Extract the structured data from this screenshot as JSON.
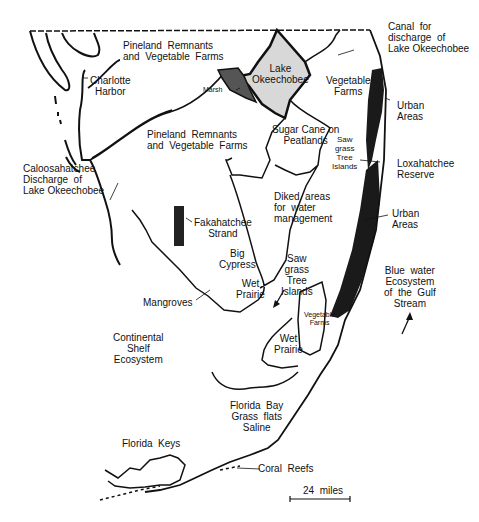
{
  "map": {
    "title": "South Florida ecosystems",
    "colors": {
      "ink": "#111111",
      "lake_fill": "#d8d8d8",
      "urban_fill": "#1a1a1a",
      "marsh_fill": "#555555",
      "background": "#ffffff"
    },
    "labels": {
      "pineland_north": "Pineland  Remnants\nand  Vegetable  Farms",
      "canal": "Canal  for\ndischarge  of\nLake Okeechobee",
      "charlotte_harbor": "Charlotte\nHarbor",
      "lake_okeechobee": "Lake\nOkeechobee",
      "marsh": "Marsh",
      "vegetable_farms_north": "Vegetable\nFarms",
      "urban_areas_north": "Urban\nAreas",
      "pineland_central": "Pineland  Remnants\nand  Vegetable  Farms",
      "sugar_cane": "Sugar Cane on\nPeatlands",
      "sawgrass_north": "Saw\ngrass\nTree\nIslands",
      "loxahatchee": "Loxahatchee\nReserve",
      "caloosahatchee": "Caloosahatchee\nDischarge  of\nLake Okeechobee",
      "diked_areas": "Diked  areas\nfor  water\nmanagement",
      "urban_areas_south": "Urban\nAreas",
      "fakahatchee": "Fakahatchee\nStrand",
      "big_cypress": "Big\nCypress",
      "wet_prairie_west": "Wet\nPrairie",
      "sawgrass_south": "Saw\ngrass\nTree\nIslands",
      "blue_water": "Blue  water\nEcosystem\nof  the  Gulf\nStream",
      "mangroves": "Mangroves",
      "vegetable_farms_south": "Vegetable\nFarms",
      "wet_prairie_east": "Wet\nPrairie",
      "continental_shelf": "Continental\nShelf\nEcosystem",
      "florida_bay": "Florida  Bay\nGrass  flats\nSaline",
      "florida_keys": "Florida  Keys",
      "coral_reefs": "Coral  Reefs"
    },
    "scale_bar": {
      "label": "24  miles"
    }
  }
}
